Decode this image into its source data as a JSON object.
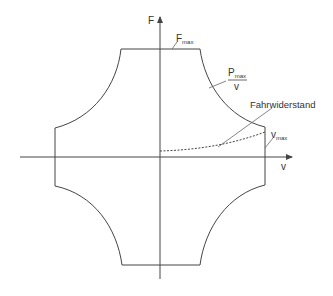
{
  "diagram": {
    "axes": {
      "y_label": "F",
      "x_label": "v"
    },
    "labels": {
      "fmax_main": "F",
      "fmax_sub": "max",
      "pmax_main": "P",
      "pmax_sub": "max",
      "pmax_denominator": "v",
      "vmax_main": "v",
      "vmax_sub": "max",
      "resistance": "Fahrwiderstand"
    },
    "colors": {
      "line": "#444444",
      "text": "#333333",
      "background": "#ffffff"
    }
  }
}
